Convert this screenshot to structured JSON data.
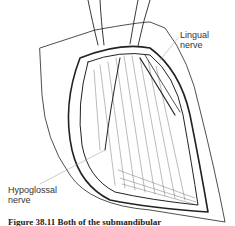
{
  "figure": {
    "type": "surgical illustration",
    "labels": {
      "lingual": [
        "Lingual",
        "nerve"
      ],
      "hypoglossal": [
        "Hypoglossal",
        "nerve"
      ]
    },
    "caption": "Figure 38.11  Both of the submandibular"
  }
}
